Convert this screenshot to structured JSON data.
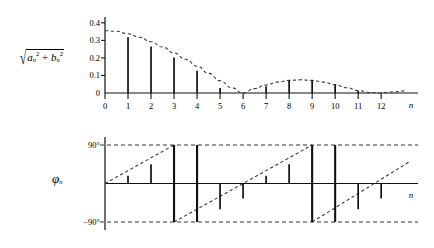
{
  "figure": {
    "background_color": "#ffffff",
    "line_color": "#111111"
  },
  "magnitude_plot": {
    "y_axis_label_parts": {
      "radical": "√",
      "a_symbol": "a",
      "b_symbol": "b",
      "subscript": "n",
      "exponent": "2",
      "plus": "+"
    },
    "y_axis_label_text": "√(aₙ² + bₙ²)",
    "x_axis_name": "n",
    "y_ticks": [
      "0",
      "0.1",
      "0.2",
      "0.3",
      "0.4"
    ],
    "x_ticks": [
      "0",
      "1",
      "2",
      "3",
      "4",
      "5",
      "6",
      "7",
      "8",
      "9",
      "10",
      "11",
      "12"
    ]
  },
  "phase_plot": {
    "y_axis_label": "φ",
    "y_axis_label_subscript": "n",
    "x_axis_name": "n",
    "y_ticks": [
      "90°",
      "-90°"
    ]
  },
  "chart_data": [
    {
      "type": "bar",
      "id": "magnitude-spectrum",
      "title": "Magnitude spectrum",
      "xlabel": "n",
      "ylabel": "sqrt(a_n^2 + b_n^2)",
      "categories": [
        0,
        1,
        2,
        3,
        4,
        5,
        6,
        7,
        8,
        9,
        10,
        11,
        12
      ],
      "values": [
        0,
        0.318,
        0.265,
        0.202,
        0.127,
        0.029,
        0.0,
        0.039,
        0.072,
        0.072,
        0.048,
        0.011,
        0.0
      ],
      "ylim": [
        0,
        0.44
      ],
      "xlim": [
        0,
        13.6
      ],
      "yticks": [
        0,
        0.1,
        0.2,
        0.3,
        0.4
      ],
      "ytick_labels": [
        "0",
        "0.1",
        "0.2",
        "0.3",
        "0.4"
      ],
      "xticks": [
        0,
        1,
        2,
        3,
        4,
        5,
        6,
        7,
        8,
        9,
        10,
        11,
        12
      ],
      "grid": false,
      "legend": null,
      "envelope": {
        "style": "dashed",
        "description": "|sinc|-type envelope peaking at 0.355 at n=0, crossing zero near n=6 and n=12, with secondary lobe peaking near 0.075 at n=8.5",
        "points": [
          [
            0,
            0.355
          ],
          [
            0.5,
            0.352
          ],
          [
            1,
            0.338
          ],
          [
            1.5,
            0.318
          ],
          [
            2,
            0.292
          ],
          [
            2.5,
            0.262
          ],
          [
            3,
            0.228
          ],
          [
            3.5,
            0.192
          ],
          [
            4,
            0.153
          ],
          [
            4.5,
            0.112
          ],
          [
            5,
            0.07
          ],
          [
            5.5,
            0.03
          ],
          [
            6,
            0.0
          ],
          [
            6.5,
            0.025
          ],
          [
            7,
            0.046
          ],
          [
            7.5,
            0.062
          ],
          [
            8,
            0.072
          ],
          [
            8.5,
            0.075
          ],
          [
            9,
            0.072
          ],
          [
            9.5,
            0.062
          ],
          [
            10,
            0.047
          ],
          [
            10.5,
            0.03
          ],
          [
            11,
            0.014
          ],
          [
            11.5,
            0.003
          ],
          [
            12,
            0.0
          ],
          [
            12.5,
            0.006
          ],
          [
            13,
            0.012
          ]
        ]
      }
    },
    {
      "type": "bar",
      "id": "phase-spectrum",
      "title": "Phase spectrum",
      "xlabel": "n",
      "ylabel": "phi_n",
      "categories": [
        0,
        1,
        2,
        3,
        4,
        5,
        6,
        7,
        8,
        9,
        10,
        11,
        12
      ],
      "values": [
        0,
        18,
        45,
        90,
        -90,
        -60,
        -35,
        18,
        45,
        90,
        -90,
        -60,
        -35
      ],
      "units": "degrees",
      "ylim": [
        -115,
        115
      ],
      "xlim": [
        0,
        13.6
      ],
      "yticks": [
        90,
        -90
      ],
      "ytick_labels": [
        "90°",
        "-90°"
      ],
      "grid": false,
      "legend": null,
      "envelope": {
        "style": "dashed",
        "description": "sawtooth ramp rising from 0 to +90 then wrapping to -90 and ramping up again; two full periods shown",
        "segments": [
          [
            [
              0,
              0
            ],
            [
              3,
              90
            ]
          ],
          [
            [
              3,
              -90
            ],
            [
              9,
              90
            ]
          ],
          [
            [
              9,
              -90
            ],
            [
              13.2,
              50
            ]
          ]
        ]
      },
      "guides": [
        {
          "value": 90,
          "style": "dashed"
        },
        {
          "value": -90,
          "style": "dashed"
        }
      ]
    }
  ]
}
